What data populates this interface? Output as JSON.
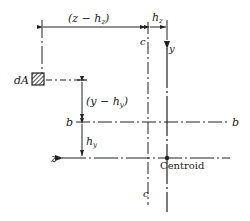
{
  "diagram": {
    "labels": {
      "dim_top_left": "(z − h",
      "dim_top_left_sub": "z",
      "dim_top_left_close": ")",
      "dim_top_right": "h",
      "dim_top_right_sub": "z",
      "element": "dA",
      "axis_y": "y",
      "axis_z": "z",
      "line_c_top": "c",
      "line_c_bottom": "c",
      "line_b_left": "b",
      "line_b_right": "b",
      "dim_left_upper": "(y − h",
      "dim_left_upper_sub": "y",
      "dim_left_upper_close": ")",
      "dim_left_lower": "h",
      "dim_left_lower_sub": "y",
      "centroid": "Centroid"
    },
    "colors": {
      "ink": "#222222",
      "background": "#ffffff"
    }
  }
}
